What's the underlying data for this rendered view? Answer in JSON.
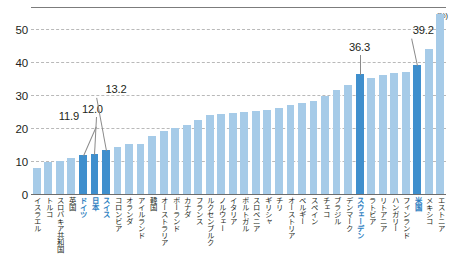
{
  "chart_data": {
    "type": "bar",
    "title": "",
    "xlabel": "",
    "ylabel": "",
    "unit_label": "(%)",
    "ylim": [
      0,
      56
    ],
    "yticks": [
      0,
      10,
      20,
      30,
      40,
      50
    ],
    "ytick_labels": [
      "0",
      "10",
      "20",
      "30",
      "40",
      "50"
    ],
    "grid": true,
    "legend": "none",
    "highlight_color": "#3f8fcd",
    "bar_color": "#a6cbe8",
    "categories": [
      "イスラエル",
      "トルコ",
      "スロバキア共和国",
      "英国",
      "ドイツ",
      "日本",
      "スイス",
      "コロンビア",
      "オランダ",
      "アイルランド",
      "韓国",
      "オーストラリア",
      "ポーランド",
      "カナダ",
      "フランス",
      "ルクセンブルク",
      "ノルウェー",
      "イタリア",
      "ポルトガル",
      "スロベニア",
      "ギリシャ",
      "チリ",
      "オーストリア",
      "ベルギー",
      "スペイン",
      "チェコ",
      "ブラジル",
      "デンマーク",
      "スウェーデン",
      "ラトビア",
      "リトアニア",
      "ハンガリー",
      "フィンランド",
      "米国",
      "メキシコ",
      "エストニア"
    ],
    "values": [
      7.9,
      9.6,
      10.2,
      11.9,
      12.0,
      13.2,
      14.6,
      15.3,
      15.2,
      17.4,
      18.5,
      19.6,
      21.2,
      23.0,
      24.1,
      24.4,
      24.4,
      24.4,
      24.6,
      25.5,
      26.3,
      27.5,
      29.0,
      30.5,
      32.2,
      36.3,
      34.6,
      35.3,
      35.6,
      35.6,
      36.0,
      39.2,
      44.0,
      55.0,
      24.0,
      24.2
    ],
    "highlighted": [
      "英国",
      "ドイツ",
      "日本",
      "スイス",
      "スウェーデン",
      "米国"
    ],
    "annotations": [
      {
        "label": "11.9",
        "category": "英国"
      },
      {
        "label": "12.0",
        "category": "ドイツ"
      },
      {
        "label": "13.2",
        "category": "日本"
      },
      {
        "label": "36.3",
        "category": "スウェーデン"
      },
      {
        "label": "39.2",
        "category": "米国"
      }
    ]
  },
  "series_ordered": [
    {
      "name": "イスラエル",
      "value": 7.9,
      "hl": false,
      "note": null
    },
    {
      "name": "トルコ",
      "value": 9.6,
      "hl": false,
      "note": null
    },
    {
      "name": "スロバキア共和国",
      "value": 10.1,
      "hl": false,
      "note": null
    },
    {
      "name": "英国",
      "value": 10.9,
      "hl": false,
      "note": null
    },
    {
      "name": "ドイツ",
      "value": 11.9,
      "hl": true,
      "note": "11.9"
    },
    {
      "name": "日本",
      "value": 12.0,
      "hl": true,
      "note": "12.0"
    },
    {
      "name": "スイス",
      "value": 13.2,
      "hl": true,
      "note": "13.2"
    },
    {
      "name": "コロンビア",
      "value": 14.2,
      "hl": false,
      "note": null
    },
    {
      "name": "オランダ",
      "value": 15.0,
      "hl": false,
      "note": null
    },
    {
      "name": "アイルランド",
      "value": 15.1,
      "hl": false,
      "note": null
    },
    {
      "name": "韓国",
      "value": 17.5,
      "hl": false,
      "note": null
    },
    {
      "name": "オーストラリア",
      "value": 19.0,
      "hl": false,
      "note": null
    },
    {
      "name": "ポーランド",
      "value": 20.0,
      "hl": false,
      "note": null
    },
    {
      "name": "カナダ",
      "value": 21.0,
      "hl": false,
      "note": null
    },
    {
      "name": "フランス",
      "value": 22.4,
      "hl": false,
      "note": null
    },
    {
      "name": "ルクセンブルク",
      "value": 24.0,
      "hl": false,
      "note": null
    },
    {
      "name": "ノルウェー",
      "value": 24.3,
      "hl": false,
      "note": null
    },
    {
      "name": "イタリア",
      "value": 24.5,
      "hl": false,
      "note": null
    },
    {
      "name": "ポルトガル",
      "value": 24.7,
      "hl": false,
      "note": null
    },
    {
      "name": "スロベニア",
      "value": 25.0,
      "hl": false,
      "note": null
    },
    {
      "name": "ギリシャ",
      "value": 25.3,
      "hl": false,
      "note": null
    },
    {
      "name": "チリ",
      "value": 26.0,
      "hl": false,
      "note": null
    },
    {
      "name": "オーストリア",
      "value": 27.0,
      "hl": false,
      "note": null
    },
    {
      "name": "ベルギー",
      "value": 27.6,
      "hl": false,
      "note": null
    },
    {
      "name": "スペイン",
      "value": 28.2,
      "hl": false,
      "note": null
    },
    {
      "name": "チェコ",
      "value": 29.6,
      "hl": false,
      "note": null
    },
    {
      "name": "ブラジル",
      "value": 31.4,
      "hl": false,
      "note": null
    },
    {
      "name": "デンマーク",
      "value": 33.0,
      "hl": false,
      "note": null
    },
    {
      "name": "スウェーデン",
      "value": 36.3,
      "hl": true,
      "note": "36.3"
    },
    {
      "name": "ラトビア",
      "value": 35.2,
      "hl": false,
      "note": null
    },
    {
      "name": "リトアニア",
      "value": 36.0,
      "hl": false,
      "note": null
    },
    {
      "name": "ハンガリー",
      "value": 36.6,
      "hl": false,
      "note": null
    },
    {
      "name": "フィンランド",
      "value": 37.0,
      "hl": false,
      "note": null
    },
    {
      "name": "米国",
      "value": 39.2,
      "hl": true,
      "note": "39.2"
    },
    {
      "name": "メキシコ",
      "value": 43.8,
      "hl": false,
      "note": null
    },
    {
      "name": "エストニア",
      "value": 54.5,
      "hl": false,
      "note": null
    }
  ]
}
